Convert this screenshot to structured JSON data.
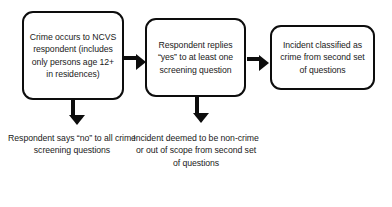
{
  "diagram": {
    "colors": {
      "stroke": "#0d0d0d",
      "text": "#1a1a1a",
      "background": "#ffffff"
    },
    "nodes": [
      {
        "id": "crime-occurs",
        "label": "Crime occurs to NCVS respondent (includes only persons age 12+ in residences)"
      },
      {
        "id": "respondent-replies-yes",
        "label": "Respondent replies “yes” to at least one screening question"
      },
      {
        "id": "incident-classified-crime",
        "label": "Incident classified as crime from second set of questions"
      }
    ],
    "captions": [
      {
        "id": "respondent-says-no",
        "label": "Respondent says “no” to all crime screening questions"
      },
      {
        "id": "incident-non-crime",
        "label": "Incident deemed to be non-crime or out of scope from second set of questions"
      }
    ],
    "connectors": [
      {
        "id": "crime-to-replies",
        "direction": "right"
      },
      {
        "id": "replies-to-classified",
        "direction": "right"
      },
      {
        "id": "crime-to-no",
        "direction": "down"
      },
      {
        "id": "replies-to-non-crime",
        "direction": "down"
      }
    ]
  }
}
